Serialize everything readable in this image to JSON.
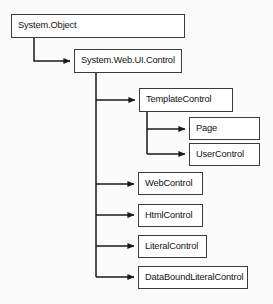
{
  "diagram": {
    "type": "class-hierarchy",
    "background_color": "#fbfbfb",
    "node_fill_color": "#ffffff",
    "node_border_color": "#3b3b3b",
    "edge_color": "#1a1a1a",
    "text_color": "#141414",
    "nodes": [
      {
        "id": "system-object",
        "label": "System.Object",
        "x": 11,
        "y": 14,
        "w": 174,
        "h": 24
      },
      {
        "id": "system-web-ui-control",
        "label": "System.Web.UI.Control",
        "x": 74,
        "y": 49,
        "w": 108,
        "h": 24
      },
      {
        "id": "template-control",
        "label": "TemplateControl",
        "x": 139,
        "y": 88,
        "w": 94,
        "h": 24
      },
      {
        "id": "page",
        "label": "Page",
        "x": 189,
        "y": 117,
        "w": 71,
        "h": 23
      },
      {
        "id": "user-control",
        "label": "UserControl",
        "x": 189,
        "y": 143,
        "w": 71,
        "h": 23
      },
      {
        "id": "web-control",
        "label": "WebControl",
        "x": 138,
        "y": 172,
        "w": 65,
        "h": 23
      },
      {
        "id": "html-control",
        "label": "HtmlControl",
        "x": 138,
        "y": 204,
        "w": 65,
        "h": 23
      },
      {
        "id": "literal-control",
        "label": "LiteralControl",
        "x": 138,
        "y": 235,
        "w": 69,
        "h": 23
      },
      {
        "id": "databound-literal-control",
        "label": "DataBoundLiteralControl",
        "x": 138,
        "y": 266,
        "w": 110,
        "h": 23
      }
    ],
    "edges": [
      {
        "id": "edge-object-to-control",
        "from": "system-object",
        "to": "system-web-ui-control"
      },
      {
        "id": "edge-control-to-template",
        "from": "system-web-ui-control",
        "to": "template-control"
      },
      {
        "id": "edge-template-to-page",
        "from": "template-control",
        "to": "page"
      },
      {
        "id": "edge-template-to-usercontrol",
        "from": "template-control",
        "to": "user-control"
      },
      {
        "id": "edge-control-to-webcontrol",
        "from": "system-web-ui-control",
        "to": "web-control"
      },
      {
        "id": "edge-control-to-htmlcontrol",
        "from": "system-web-ui-control",
        "to": "html-control"
      },
      {
        "id": "edge-control-to-literalcontrol",
        "from": "system-web-ui-control",
        "to": "literal-control"
      },
      {
        "id": "edge-control-to-databound",
        "from": "system-web-ui-control",
        "to": "databound-literal-control"
      }
    ]
  }
}
